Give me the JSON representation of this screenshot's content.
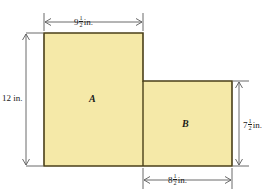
{
  "figure": {
    "type": "composite-rectangle-area-diagram",
    "shape": "L-shaped step polygon composed of two rectangles",
    "fill_color": "#F5E9A8",
    "stroke_color": "#4A3F18",
    "background_color": "#FFFFFF",
    "regions": [
      {
        "id": "A",
        "label": "A",
        "width_in": 9.5,
        "height_in": 12
      },
      {
        "id": "B",
        "label": "B",
        "width_in": 8.5,
        "height_in": 7.5
      }
    ],
    "dimensions": {
      "top": {
        "whole": "9",
        "num": "1",
        "den": "2",
        "unit": "in.",
        "full": "9 1/2 in."
      },
      "left": {
        "whole": "12",
        "num": "",
        "den": "",
        "unit": "in.",
        "full": "12 in."
      },
      "right": {
        "whole": "7",
        "num": "1",
        "den": "2",
        "unit": "in.",
        "full": "7 1/2 in."
      },
      "bottom": {
        "whole": "8",
        "num": "1",
        "den": "2",
        "unit": "in.",
        "full": "8 1/2 in."
      }
    }
  }
}
